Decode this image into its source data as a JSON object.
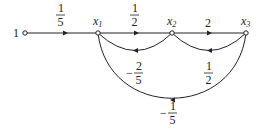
{
  "diagram": {
    "type": "signal-flow-graph",
    "nodes": [
      {
        "id": "input",
        "label": "1",
        "x": 25,
        "y": 33
      },
      {
        "id": "x1",
        "label": "x",
        "sub": "1",
        "x": 98,
        "y": 33
      },
      {
        "id": "x2",
        "label": "x",
        "sub": "2",
        "x": 172,
        "y": 33
      },
      {
        "id": "x3",
        "label": "x",
        "sub": "3",
        "x": 246,
        "y": 33
      }
    ],
    "edges": [
      {
        "from": "input",
        "to": "x1",
        "gain": {
          "sign": "",
          "num": "1",
          "den": "5"
        }
      },
      {
        "from": "x1",
        "to": "x2",
        "gain": {
          "sign": "",
          "num": "1",
          "den": "2"
        }
      },
      {
        "from": "x2",
        "to": "x3",
        "gain": {
          "sign": "",
          "num": "2",
          "den": ""
        }
      },
      {
        "from": "x2",
        "to": "x1",
        "gain": {
          "sign": "−",
          "num": "2",
          "den": "5"
        }
      },
      {
        "from": "x3",
        "to": "x2",
        "gain": {
          "sign": "",
          "num": "1",
          "den": "2"
        }
      },
      {
        "from": "x3",
        "to": "x1",
        "gain": {
          "sign": "−",
          "num": "1",
          "den": "5"
        }
      }
    ]
  },
  "labels": {
    "input": "1",
    "x1": "x",
    "x1_sub": "1",
    "x2": "x",
    "x2_sub": "2",
    "x3": "x",
    "x3_sub": "3",
    "g_in_num": "1",
    "g_in_den": "5",
    "g_12_num": "1",
    "g_12_den": "2",
    "g_23": "2",
    "g_21_sign": "−",
    "g_21_num": "2",
    "g_21_den": "5",
    "g_32_num": "1",
    "g_32_den": "2",
    "g_31_sign": "−",
    "g_31_num": "1",
    "g_31_den": "5"
  }
}
